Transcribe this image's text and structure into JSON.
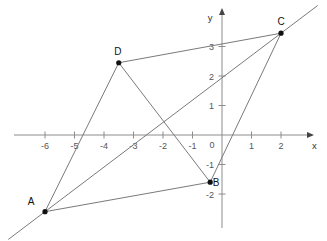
{
  "figure": {
    "kind": "coordinate-plane-diagram",
    "background_color": "#ffffff",
    "axis_color": "#8c8c8c",
    "segment_color": "#7a7a7a",
    "point_color": "#111111"
  },
  "axes": {
    "x_label": "x",
    "y_label": "y",
    "origin_label": "0",
    "x_ticks": [
      {
        "value": -6,
        "label": "-6"
      },
      {
        "value": -5,
        "label": "-5"
      },
      {
        "value": -4,
        "label": "-4"
      },
      {
        "value": -3,
        "label": "-3"
      },
      {
        "value": -2,
        "label": "-2"
      },
      {
        "value": -1,
        "label": "-1"
      },
      {
        "value": 1,
        "label": "1"
      },
      {
        "value": 2,
        "label": "2"
      }
    ],
    "y_ticks": [
      {
        "value": 3,
        "label": "3"
      },
      {
        "value": 2,
        "label": "2"
      },
      {
        "value": 1,
        "label": "1"
      },
      {
        "value": -1,
        "label": "-1"
      },
      {
        "value": -2,
        "label": "-2"
      }
    ],
    "x_range": [
      -6.9,
      2.9
    ],
    "y_range": [
      -2.9,
      3.6
    ]
  },
  "chart_data": {
    "type": "scatter",
    "title": "",
    "xlabel": "x",
    "ylabel": "y",
    "grid": false,
    "legend": "none",
    "xlim": [
      -6.9,
      2.9
    ],
    "ylim": [
      -2.9,
      3.6
    ],
    "points": [
      {
        "name": "A",
        "x": -6,
        "y": -2.6,
        "label": "A",
        "label_dx": -14,
        "label_dy": -7
      },
      {
        "name": "B",
        "x": -0.4,
        "y": -1.6,
        "label": "B",
        "label_dx": 6,
        "label_dy": 4
      },
      {
        "name": "C",
        "x": 2,
        "y": 3.45,
        "label": "C",
        "label_dx": 0,
        "label_dy": -8
      },
      {
        "name": "D",
        "x": -3.5,
        "y": 2.45,
        "label": "D",
        "label_dx": -1,
        "label_dy": -8
      }
    ],
    "segments": [
      {
        "from": "A",
        "to": "B"
      },
      {
        "from": "B",
        "to": "C"
      },
      {
        "from": "C",
        "to": "D"
      },
      {
        "from": "D",
        "to": "A"
      },
      {
        "from": "D",
        "to": "B"
      }
    ],
    "rays": [
      {
        "through": [
          "A",
          "C"
        ],
        "extend_both": true,
        "description": "line through A and C extended beyond both endpoints"
      }
    ]
  }
}
